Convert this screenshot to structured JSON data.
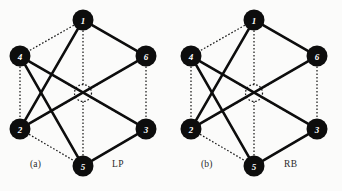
{
  "figure": {
    "background_color": "#fbfbfa",
    "node_fill_color": "#0d0d0d",
    "node_label_color": "#ffffff",
    "solid_edge_color": "#0d0d0d",
    "dotted_edge_color": "#1a1a1a",
    "panels": [
      {
        "id": "a",
        "caption_index": "(a)",
        "caption_code": "LP",
        "center": {
          "x": 83,
          "y": 93
        },
        "node_radius": 10.5,
        "ring_radius": 74,
        "center_circle_radius": 8.5,
        "nodes": [
          {
            "label": "1",
            "x": 83,
            "y": 20
          },
          {
            "label": "4",
            "x": 20,
            "y": 56
          },
          {
            "label": "6",
            "x": 146,
            "y": 56
          },
          {
            "label": "2",
            "x": 20,
            "y": 129
          },
          {
            "label": "3",
            "x": 146,
            "y": 129
          },
          {
            "label": "5",
            "x": 83,
            "y": 166
          }
        ],
        "solid_edges": [
          [
            "1",
            "2"
          ],
          [
            "2",
            "6"
          ],
          [
            "6",
            "1"
          ],
          [
            "5",
            "4"
          ],
          [
            "4",
            "3"
          ],
          [
            "3",
            "5"
          ]
        ],
        "dotted_edges": [
          [
            "1",
            "4"
          ],
          [
            "1",
            "6"
          ],
          [
            "4",
            "2"
          ],
          [
            "6",
            "3"
          ],
          [
            "2",
            "5"
          ],
          [
            "3",
            "5"
          ]
        ],
        "dotted_spokes": [
          "1",
          "2",
          "3",
          "4",
          "5",
          "6"
        ]
      },
      {
        "id": "b",
        "caption_index": "(b)",
        "caption_code": "RB",
        "center": {
          "x": 83,
          "y": 93
        },
        "node_radius": 10.5,
        "ring_radius": 74,
        "center_circle_radius": 8.5,
        "nodes": [
          {
            "label": "1",
            "x": 83,
            "y": 20
          },
          {
            "label": "4",
            "x": 20,
            "y": 56
          },
          {
            "label": "6",
            "x": 146,
            "y": 56
          },
          {
            "label": "2",
            "x": 20,
            "y": 129
          },
          {
            "label": "3",
            "x": 146,
            "y": 129
          },
          {
            "label": "5",
            "x": 83,
            "y": 166
          }
        ],
        "solid_edges": [
          [
            "1",
            "2"
          ],
          [
            "2",
            "6"
          ],
          [
            "6",
            "1"
          ],
          [
            "5",
            "4"
          ],
          [
            "4",
            "3"
          ],
          [
            "3",
            "5"
          ]
        ],
        "dotted_edges": [
          [
            "1",
            "4"
          ],
          [
            "1",
            "6"
          ],
          [
            "4",
            "2"
          ],
          [
            "6",
            "3"
          ],
          [
            "2",
            "5"
          ],
          [
            "3",
            "5"
          ]
        ],
        "dotted_spokes": [
          "1",
          "2",
          "3",
          "4",
          "5",
          "6"
        ]
      }
    ]
  }
}
